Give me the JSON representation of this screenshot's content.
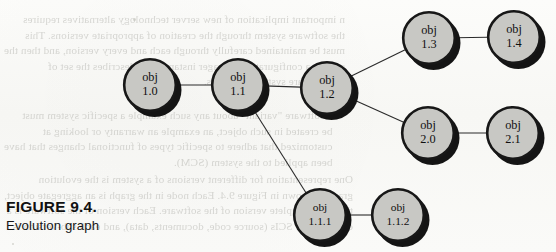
{
  "figure": {
    "caption_title": "FIGURE 9.4.",
    "caption_subtitle": "Evolution graph"
  },
  "colors": {
    "node_fill": "#c8c8c4",
    "node_stroke": "#171717",
    "node_shadow": "#141414",
    "edge": "#2b2b2b",
    "page_background": "#fbfbf9",
    "ghost_text": "#b9b9b4"
  },
  "graph": {
    "type": "evolution-graph",
    "nodes": [
      {
        "id": "obj-1-0",
        "line1": "obj",
        "line2": "1.0",
        "cx": 150,
        "cy": 85,
        "r": 27
      },
      {
        "id": "obj-1-1",
        "line1": "obj",
        "line2": "1.1",
        "cx": 238,
        "cy": 85,
        "r": 27
      },
      {
        "id": "obj-1-2",
        "line1": "obj",
        "line2": "1.2",
        "cx": 327,
        "cy": 88,
        "r": 27
      },
      {
        "id": "obj-1-3",
        "line1": "obj",
        "line2": "1.3",
        "cx": 429,
        "cy": 38,
        "r": 27
      },
      {
        "id": "obj-1-4",
        "line1": "obj",
        "line2": "1.4",
        "cx": 514,
        "cy": 37,
        "r": 27
      },
      {
        "id": "obj-2-0",
        "line1": "obj",
        "line2": "2.0",
        "cx": 428,
        "cy": 133,
        "r": 27
      },
      {
        "id": "obj-2-1",
        "line1": "obj",
        "line2": "2.1",
        "cx": 513,
        "cy": 133,
        "r": 27
      },
      {
        "id": "obj-1-1-1",
        "line1": "obj",
        "line2": "1.1.1",
        "cx": 320,
        "cy": 215,
        "r": 27
      },
      {
        "id": "obj-1-1-2",
        "line1": "obj",
        "line2": "1.1.2",
        "cx": 398,
        "cy": 215,
        "r": 27
      }
    ],
    "edges": [
      {
        "from": "obj-1-0",
        "to": "obj-1-1"
      },
      {
        "from": "obj-1-1",
        "to": "obj-1-2"
      },
      {
        "from": "obj-1-2",
        "to": "obj-1-3"
      },
      {
        "from": "obj-1-3",
        "to": "obj-1-4"
      },
      {
        "from": "obj-1-2",
        "to": "obj-2-0"
      },
      {
        "from": "obj-2-0",
        "to": "obj-2-1"
      },
      {
        "from": "obj-1-1",
        "to": "obj-1-1-1"
      },
      {
        "from": "obj-1-1-1",
        "to": "obj-1-1-2"
      }
    ]
  },
  "background_ghost_text": {
    "top": "n important implication of new server technology alternatives requires\nthe software system through the creation of appropriate versions. This\nmust be maintained carefully through each and every version, and then the\nsystem a configuration manager instance that describes the set of\nthe software system's versions.",
    "middle": "a software \"variant\" about any such example a specific system must\nbe created in such object, an example an warranty or looking at\ncustomized that adhere to specific types of functional changes that have\nbeen applied to the system (SCM).",
    "bottom": "One representation for different versions of a system is the evolution\ngraph as shown in Figure 9.4. Each node in the graph is an aggregate object,\nthat is, a complete version of the software. Each version of the software is a\ncollection of SCIs (source code, documents, data), and each sub-version is"
  }
}
